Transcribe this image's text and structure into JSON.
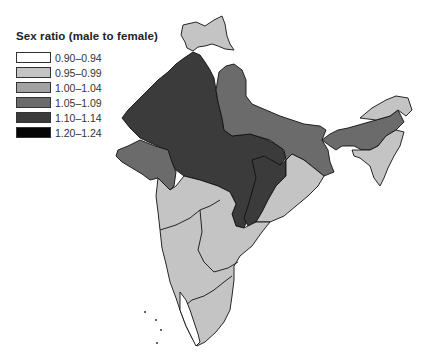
{
  "legend": {
    "title": "Sex ratio (male to female)",
    "items": [
      {
        "label": "0.90–0.94",
        "color": "#ffffff"
      },
      {
        "label": "0.95–0.99",
        "color": "#c4c4c4"
      },
      {
        "label": "1.00–1.04",
        "color": "#a2a2a2"
      },
      {
        "label": "1.05–1.09",
        "color": "#6b6b6b"
      },
      {
        "label": "1.10–1.14",
        "color": "#3b3b3b"
      },
      {
        "label": "1.20–1.24",
        "color": "#050505"
      }
    ]
  },
  "map": {
    "region": "India",
    "regions": [
      {
        "name": "Jammu & Kashmir",
        "class": "0.95–0.99"
      },
      {
        "name": "Punjab / Haryana / Rajasthan / Madhya Pradesh",
        "class": "1.10–1.14"
      },
      {
        "name": "Uttar Pradesh / Bihar / Jharkhand / West Bengal",
        "class": "1.05–1.09"
      },
      {
        "name": "Gujarat",
        "class": "1.05–1.09"
      },
      {
        "name": "Chhattisgarh",
        "class": "1.10–1.14"
      },
      {
        "name": "Assam / Arunachal Pradesh",
        "class": "1.05–1.09"
      },
      {
        "name": "Northeast states",
        "class": "0.95–0.99"
      },
      {
        "name": "Maharashtra / Andhra Pradesh / Karnataka / Tamil Nadu / Orissa",
        "class": "0.95–0.99"
      },
      {
        "name": "Kerala",
        "class": "0.90–0.94"
      }
    ]
  }
}
